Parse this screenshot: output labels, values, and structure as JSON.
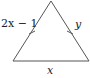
{
  "diagram": {
    "type": "isosceles-triangle",
    "labels": {
      "left_side": "2x − 1",
      "right_side": "y",
      "base": "x"
    },
    "congruence_marks": "single tick on left and right sides",
    "stroke_color": "#555555"
  }
}
